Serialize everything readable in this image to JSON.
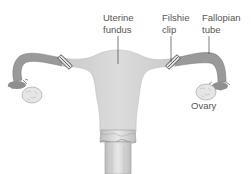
{
  "diagram": {
    "labels": {
      "uterine_fundus": "Uterine\nfundus",
      "filshie_clip": "Filshie\nclip",
      "fallopian_tube": "Fallopian\ntube",
      "ovary": "Ovary"
    },
    "colors": {
      "tube": "#9a9a9a",
      "uterus": "#d4d4d4",
      "ovary": "#e6e6e6",
      "clip": "#6a6a6a",
      "leader": "#444444",
      "text": "#555555"
    }
  }
}
